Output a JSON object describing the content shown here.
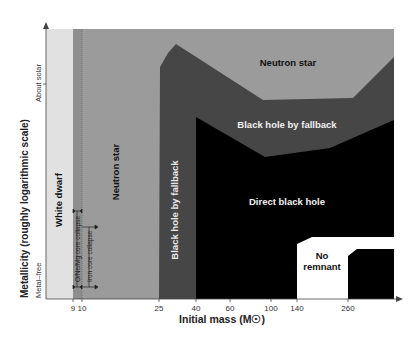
{
  "chart_data": {
    "type": "area",
    "title": "",
    "xlabel": "Initial mass (M☉)",
    "ylabel": "Metallicity (roughly logarithmic scale)",
    "x_ticks": [
      "9",
      "10",
      "25",
      "40",
      "60",
      "100",
      "140",
      "260"
    ],
    "y_ticks": [
      "Metal–free",
      "About solar"
    ],
    "regions": [
      {
        "name": "White dwarf",
        "x_range": [
          0,
          9
        ],
        "color": "#e1e1e1"
      },
      {
        "name": "Neutron star",
        "x_range": [
          9,
          300
        ],
        "color": "#9b9b9b"
      },
      {
        "name": "Black hole by fallback",
        "x_range": [
          25,
          300
        ],
        "color": "#464646"
      },
      {
        "name": "Direct black hole",
        "x_range": [
          40,
          300
        ],
        "color": "#000000"
      },
      {
        "name": "No remnant",
        "x_range": [
          140,
          260
        ],
        "color": "#ffffff"
      }
    ],
    "annotations": [
      "O/Ne/Mg core collapse",
      "Iron core collapse"
    ],
    "labels": {
      "white_dwarf": "White dwarf",
      "neutron_star_left": "Neutron star",
      "neutron_star_top": "Neutron star",
      "bh_fallback_vertical": "Black hole by fallback",
      "bh_fallback": "Black hole by fallback",
      "direct_bh": "Direct black hole",
      "no_remnant_1": "No",
      "no_remnant_2": "remnant",
      "onemg": "O/Ne/Mg core collapse",
      "iron": "Iron core collapse"
    },
    "grid": false,
    "legend": "none"
  }
}
